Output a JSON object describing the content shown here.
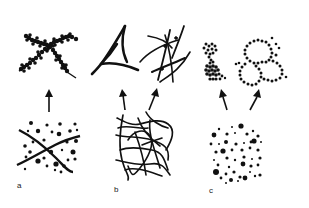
{
  "figure": {
    "panels": [
      {
        "label": "a",
        "before": "dispersed particles with crossing fibers",
        "after": "particle-decorated crossed fibers"
      },
      {
        "label": "b",
        "before": "entangled fiber mesh",
        "after": [
          "curved triangular network node",
          "crossed fiber network"
        ]
      },
      {
        "label": "c",
        "before": "dispersed particles of varied size",
        "after": [
          "compact particle cluster",
          "particle ring network"
        ]
      }
    ],
    "colors": {
      "ink": "#111111",
      "background": "#ffffff"
    }
  }
}
